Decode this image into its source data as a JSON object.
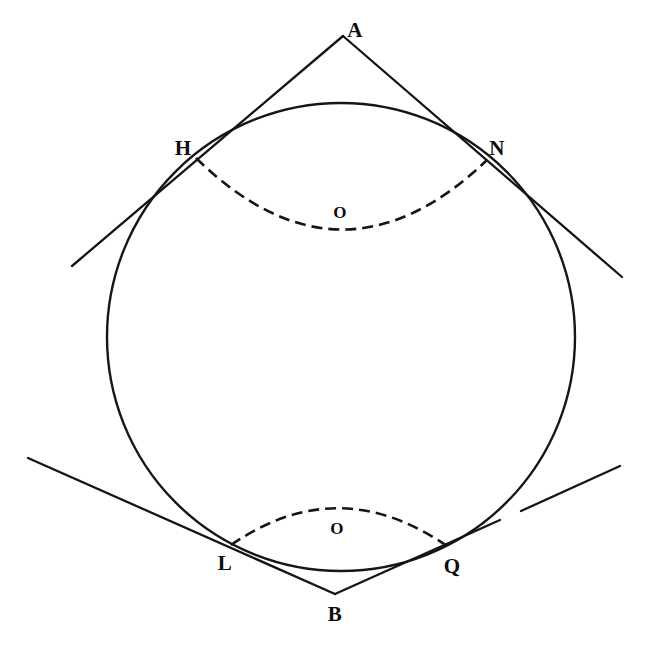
{
  "figure": {
    "background_color": "#ffffff",
    "ink_color": "#141414",
    "width": 647,
    "height": 667
  },
  "circle": {
    "name": "main-circle",
    "center_x": 341,
    "center_y": 337,
    "radius": 234,
    "style": "solid"
  },
  "points": [
    {
      "id": "A",
      "label": "A",
      "x": 343,
      "y": 32,
      "label_x": 355,
      "label_y": 30,
      "role": "upper-external-point"
    },
    {
      "id": "H",
      "label": "H",
      "x": 196,
      "y": 158,
      "label_x": 183,
      "label_y": 148,
      "role": "upper-left-tangency"
    },
    {
      "id": "N",
      "label": "N",
      "x": 487,
      "y": 160,
      "label_x": 497,
      "label_y": 148,
      "role": "upper-right-tangency"
    },
    {
      "id": "O1",
      "label": "O",
      "x": 340,
      "y": 228,
      "label_x": 340,
      "label_y": 212,
      "role": "upper-arc-center-label"
    },
    {
      "id": "L",
      "label": "L",
      "x": 231,
      "y": 545,
      "label_x": 225,
      "label_y": 563,
      "role": "lower-left-tangency"
    },
    {
      "id": "Q",
      "label": "Q",
      "x": 447,
      "y": 546,
      "label_x": 452,
      "label_y": 566,
      "role": "lower-right-tangency"
    },
    {
      "id": "O2",
      "label": "O",
      "x": 337,
      "y": 512,
      "label_x": 337,
      "label_y": 528,
      "role": "lower-arc-center-label"
    },
    {
      "id": "B",
      "label": "B",
      "x": 335,
      "y": 594,
      "label_x": 335,
      "label_y": 614,
      "role": "lower-external-point"
    }
  ],
  "lines": [
    {
      "id": "tangent-A-H",
      "from": "A",
      "to": "H",
      "x1": 343,
      "y1": 36,
      "x2": 72,
      "y2": 266,
      "style": "solid"
    },
    {
      "id": "tangent-A-N",
      "from": "A",
      "to": "N",
      "x1": 343,
      "y1": 36,
      "x2": 622,
      "y2": 277,
      "style": "solid"
    },
    {
      "id": "tangent-B-L",
      "from": "B",
      "to": "L",
      "x1": 335,
      "y1": 594,
      "x2": 28,
      "y2": 458,
      "style": "solid"
    },
    {
      "id": "tangent-B-Q",
      "from": "B",
      "to": "Q",
      "x1": 335,
      "y1": 594,
      "x2": 620,
      "y2": 466,
      "style": "solid"
    }
  ],
  "arcs": [
    {
      "id": "upper-dashed-arc",
      "from": "H",
      "to": "N",
      "sagitta_y": 228,
      "style": "dashed"
    },
    {
      "id": "lower-dashed-arc",
      "from": "L",
      "to": "Q",
      "sagitta_y": 508,
      "style": "dashed"
    }
  ]
}
